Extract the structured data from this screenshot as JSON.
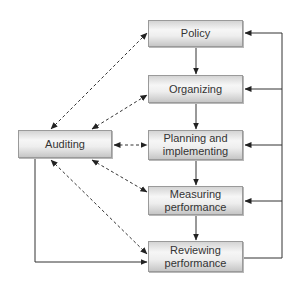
{
  "diagram": {
    "nodes": [
      {
        "id": "policy",
        "label": "Policy"
      },
      {
        "id": "organizing",
        "label": "Organizing"
      },
      {
        "id": "planning",
        "label": "Planning and\nimplementing"
      },
      {
        "id": "measuring",
        "label": "Measuring\nperformance"
      },
      {
        "id": "reviewing",
        "label": "Reviewing\nperformance"
      },
      {
        "id": "auditing",
        "label": "Auditing"
      }
    ],
    "edges": [
      {
        "from": "policy",
        "to": "organizing",
        "style": "solid"
      },
      {
        "from": "organizing",
        "to": "planning",
        "style": "solid"
      },
      {
        "from": "planning",
        "to": "measuring",
        "style": "solid"
      },
      {
        "from": "measuring",
        "to": "reviewing",
        "style": "solid"
      },
      {
        "from": "reviewing",
        "to": "policy",
        "style": "solid-feedback"
      },
      {
        "from": "reviewing",
        "to": "organizing",
        "style": "solid-feedback"
      },
      {
        "from": "reviewing",
        "to": "planning",
        "style": "solid-feedback"
      },
      {
        "from": "reviewing",
        "to": "measuring",
        "style": "solid-feedback"
      },
      {
        "from": "auditing",
        "to": "reviewing",
        "style": "solid"
      },
      {
        "from": "auditing",
        "to": "policy",
        "style": "dashed-bidirectional"
      },
      {
        "from": "auditing",
        "to": "organizing",
        "style": "dashed-bidirectional"
      },
      {
        "from": "auditing",
        "to": "planning",
        "style": "dashed-bidirectional"
      },
      {
        "from": "auditing",
        "to": "measuring",
        "style": "dashed-bidirectional"
      },
      {
        "from": "auditing",
        "to": "reviewing",
        "style": "dashed-bidirectional"
      }
    ]
  }
}
